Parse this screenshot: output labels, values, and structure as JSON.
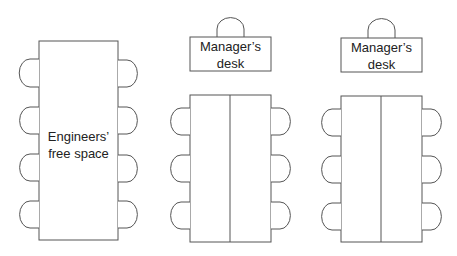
{
  "diagram": {
    "title": "",
    "areas": [
      {
        "id": "engineers",
        "label_line1": "Engineers’",
        "label_line2": "free space",
        "chairs_per_side": 4
      },
      {
        "id": "team1",
        "desk_label_line1": "Manager’s",
        "desk_label_line2": "desk",
        "chairs_per_side": 3
      },
      {
        "id": "team2",
        "desk_label_line1": "Manager’s",
        "desk_label_line2": "desk",
        "chairs_per_side": 3
      }
    ],
    "stroke_color": "#555555"
  }
}
